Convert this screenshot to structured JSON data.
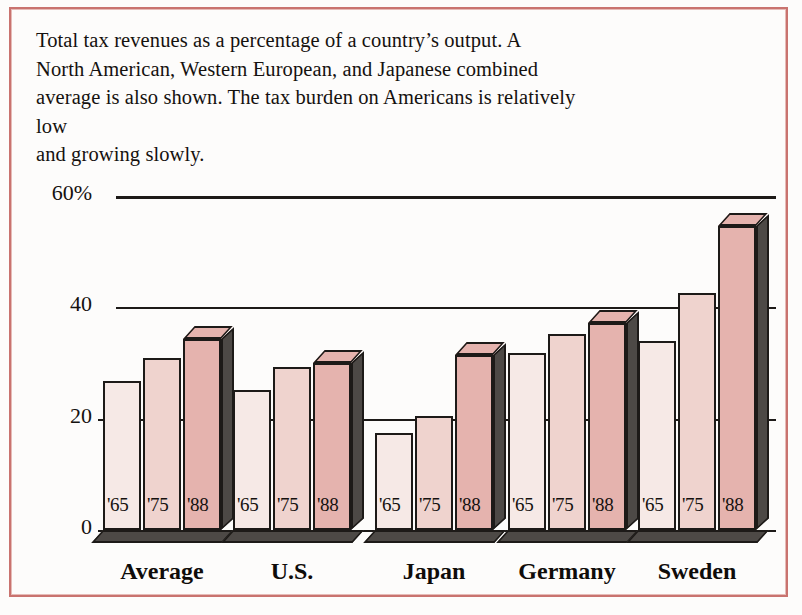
{
  "caption": {
    "line1": "Total tax revenues as a percentage of a country’s output. A",
    "line2": "North American, Western European, and Japanese combined",
    "line3": "average is also shown. The tax burden on Americans is relatively low",
    "line4": "and growing slowly."
  },
  "colors": {
    "frame": "#c9736f",
    "axis": "#1d1a18",
    "bar_1965": "#f6e9e6",
    "bar_1975": "#efd3ce",
    "bar_1988": "#e5b3ae",
    "bar_side": "#4d4946",
    "text": "#15110f"
  },
  "chart_data": {
    "type": "bar",
    "title": "Total tax revenues as a percentage of a country’s output",
    "xlabel": "",
    "ylabel": "",
    "ylim": [
      0,
      60
    ],
    "yticks": [
      0,
      20,
      40,
      60
    ],
    "ytick_labels": [
      "0",
      "20",
      "40",
      "60%"
    ],
    "grid": true,
    "legend": "in-bar era labels",
    "categories": [
      "Average",
      "U.S.",
      "Japan",
      "Germany",
      "Sweden"
    ],
    "series": [
      {
        "name": "'65",
        "values": [
          26.8,
          25.2,
          17.5,
          31.8,
          34.0
        ]
      },
      {
        "name": "'75",
        "values": [
          30.9,
          29.2,
          20.4,
          35.2,
          42.6
        ]
      },
      {
        "name": "'88",
        "values": [
          34.3,
          30.0,
          31.4,
          37.1,
          54.6
        ]
      }
    ],
    "era_labels": [
      "'65",
      "'75",
      "'88"
    ]
  }
}
